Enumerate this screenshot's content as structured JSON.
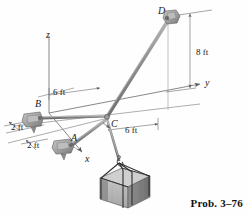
{
  "figure": {
    "caption": "Prob. 3–76",
    "colors": {
      "line": "#6f6f6f",
      "dark_line": "#4a4a4a",
      "cable": "#8a8a8a",
      "crate_front": "#b9b9b9",
      "crate_side": "#8d8d8d",
      "crate_top": "#d2d2d2",
      "bracket": "#a9a9a9",
      "text": "#1a1a1a"
    }
  },
  "axes": [
    {
      "name": "z-axis",
      "label": "z",
      "x": 46,
      "y": 30
    },
    {
      "name": "y-axis",
      "label": "y",
      "x": 205,
      "y": 78
    },
    {
      "name": "x-axis",
      "label": "x",
      "x": 85,
      "y": 154
    }
  ],
  "points": [
    {
      "name": "point-d",
      "label": "D",
      "x": 158,
      "y": 6,
      "node_x": 170,
      "node_y": 17
    },
    {
      "name": "point-c",
      "label": "C",
      "x": 111,
      "y": 119,
      "node_x": 107,
      "node_y": 117
    },
    {
      "name": "point-b",
      "label": "B",
      "x": 35,
      "y": 99,
      "node_x": 36,
      "node_y": 118
    },
    {
      "name": "point-a",
      "label": "A",
      "x": 71,
      "y": 133,
      "node_x": 66,
      "node_y": 145
    }
  ],
  "dimensions": [
    {
      "name": "dim-6ft-top",
      "label": "6 ft",
      "x": 53,
      "y": 88
    },
    {
      "name": "dim-6ft-right",
      "label": "6 ft",
      "x": 125,
      "y": 126
    },
    {
      "name": "dim-2ft-upper",
      "label": "2 ft",
      "x": 11,
      "y": 123
    },
    {
      "name": "dim-2ft-lower",
      "label": "2 ft",
      "x": 27,
      "y": 141
    },
    {
      "name": "dim-8ft",
      "label": "8 ft",
      "x": 196,
      "y": 48
    }
  ]
}
